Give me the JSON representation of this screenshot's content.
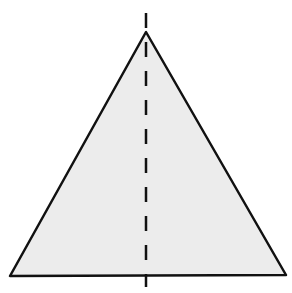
{
  "diagram": {
    "triangle": {
      "apex": [
        146,
        32
      ],
      "bottom_left": [
        10,
        276
      ],
      "bottom_right": [
        286,
        275
      ],
      "fill": "#ececec",
      "stroke": "#111111",
      "stroke_width": 2.5
    },
    "symmetry_line": {
      "x": 146,
      "y_start": 13,
      "y_end": 287,
      "stroke": "#111111",
      "stroke_width": 2.5,
      "dash": "15 14"
    }
  }
}
